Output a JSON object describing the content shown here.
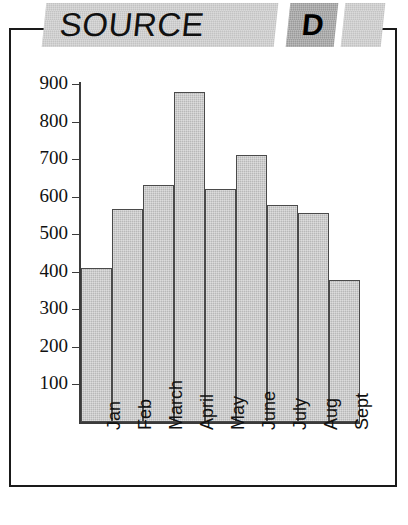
{
  "banner": {
    "title": "SOURCE",
    "letter": "D"
  },
  "chart_data": {
    "type": "bar",
    "title": "SOURCE",
    "xlabel": "",
    "ylabel": "",
    "categories": [
      "Jan",
      "Feb",
      "March",
      "April",
      "May",
      "June",
      "July",
      "Aug",
      "Sept"
    ],
    "values": [
      410,
      568,
      630,
      880,
      620,
      712,
      577,
      557,
      378
    ],
    "ylim": [
      0,
      900
    ],
    "ytick_labels": [
      "900",
      "800",
      "700",
      "600",
      "500",
      "400",
      "300",
      "200",
      "100"
    ],
    "yticks": [
      900,
      800,
      700,
      600,
      500,
      400,
      300,
      200,
      100
    ],
    "grid": false,
    "legend": false,
    "bar_fill": "#b8b8b8",
    "bar_edge": "#4a4a4a",
    "axis_color": "#3b3b3b"
  }
}
